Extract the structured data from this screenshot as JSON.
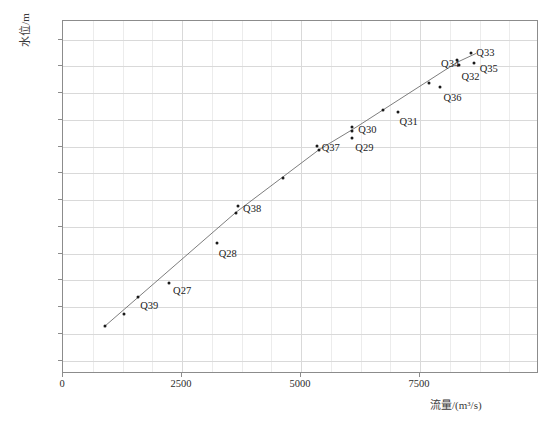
{
  "chart_data": {
    "type": "scatter",
    "title": "",
    "xlabel": "流量/(m³/s)",
    "ylabel": "水位/m",
    "xlim": [
      0,
      10000
    ],
    "ylim": [
      21.5,
      34.7
    ],
    "grid": true,
    "legend": "none",
    "x_ticks": [
      {
        "value": 0,
        "label": "0"
      },
      {
        "value": 2500,
        "label": "2500"
      },
      {
        "value": 5000,
        "label": "5000"
      },
      {
        "value": 7500,
        "label": "7500"
      }
    ],
    "x_minor_step": 625,
    "y_ticks": [
      {
        "value": 22.0,
        "label": "22. 00"
      },
      {
        "value": 23.0,
        "label": "23. 00"
      },
      {
        "value": 24.0,
        "label": "24. 00"
      },
      {
        "value": 25.0,
        "label": "25. 00"
      },
      {
        "value": 26.0,
        "label": "26. 00"
      },
      {
        "value": 27.0,
        "label": "27. 00"
      },
      {
        "value": 28.0,
        "label": "28. 00"
      },
      {
        "value": 29.0,
        "label": "29. 00"
      },
      {
        "value": 30.0,
        "label": "30. 00"
      },
      {
        "value": 31.0,
        "label": "31. 00"
      },
      {
        "value": 32.0,
        "label": "32. 00"
      },
      {
        "value": 33.0,
        "label": "33. 00"
      },
      {
        "value": 34.0,
        "label": "34. 00"
      }
    ],
    "series": [
      {
        "name": "rating curve points",
        "marker": "dot",
        "color": "#1a1a1a",
        "points": [
          {
            "x": 900,
            "y": 23.25,
            "label": ""
          },
          {
            "x": 1300,
            "y": 23.7,
            "label": ""
          },
          {
            "x": 1600,
            "y": 24.35,
            "label": "Q39"
          },
          {
            "x": 2250,
            "y": 24.85,
            "label": "Q27"
          },
          {
            "x": 3250,
            "y": 26.35,
            "label": "Q28"
          },
          {
            "x": 3700,
            "y": 27.75,
            "label": "Q38"
          },
          {
            "x": 3650,
            "y": 27.5,
            "label": ""
          },
          {
            "x": 4650,
            "y": 28.8,
            "label": ""
          },
          {
            "x": 5350,
            "y": 30.0,
            "label": "Q37"
          },
          {
            "x": 5400,
            "y": 29.85,
            "label": ""
          },
          {
            "x": 6100,
            "y": 30.7,
            "label": "Q30"
          },
          {
            "x": 6100,
            "y": 30.55,
            "label": ""
          },
          {
            "x": 6100,
            "y": 30.3,
            "label": "Q29"
          },
          {
            "x": 6750,
            "y": 31.35,
            "label": ""
          },
          {
            "x": 7050,
            "y": 31.25,
            "label": "Q31"
          },
          {
            "x": 7700,
            "y": 32.35,
            "label": ""
          },
          {
            "x": 7950,
            "y": 32.2,
            "label": "Q36"
          },
          {
            "x": 8300,
            "y": 33.2,
            "label": "Q34"
          },
          {
            "x": 8350,
            "y": 33.0,
            "label": "Q32"
          },
          {
            "x": 8600,
            "y": 33.45,
            "label": "Q33"
          },
          {
            "x": 8650,
            "y": 33.1,
            "label": "Q35"
          }
        ]
      }
    ],
    "fit_line": {
      "name": "rating curve",
      "color": "#6e6e6e",
      "points": [
        {
          "x": 880,
          "y": 23.22
        },
        {
          "x": 3650,
          "y": 27.5
        },
        {
          "x": 5400,
          "y": 29.85
        },
        {
          "x": 6100,
          "y": 30.6
        },
        {
          "x": 8300,
          "y": 33.12
        },
        {
          "x": 8700,
          "y": 33.45
        }
      ]
    },
    "point_labels": [
      "Q39",
      "Q27",
      "Q28",
      "Q38",
      "Q37",
      "Q29",
      "Q30",
      "Q31",
      "Q36",
      "Q32",
      "Q34",
      "Q33",
      "Q35"
    ]
  }
}
